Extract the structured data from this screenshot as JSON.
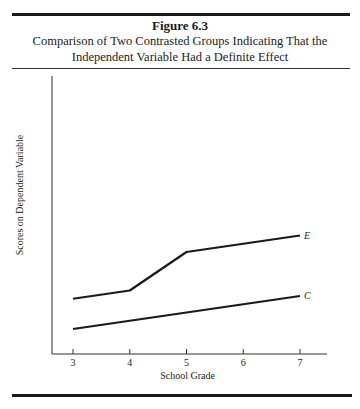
{
  "figure": {
    "number": "Figure 6.3",
    "caption_line1": "Comparison of Two Contrasted Groups Indicating That the",
    "caption_line2": "Independent Variable Had a Definite Effect"
  },
  "chart_data": {
    "type": "line",
    "title": "Comparison of Two Contrasted Groups Indicating That the Independent Variable Had a Definite Effect",
    "xlabel": "School Grade",
    "ylabel": "Scores on Dependent Variable",
    "x": [
      3,
      4,
      5,
      6,
      7
    ],
    "x_ticks": [
      "3",
      "4",
      "5",
      "6",
      "7"
    ],
    "y_ticks": [],
    "grid": false,
    "legend": "inline labels at line ends",
    "series": [
      {
        "name": "E",
        "label": "E",
        "x": [
          3,
          4,
          5,
          7
        ],
        "values": [
          1.9,
          2.2,
          3.6,
          4.2
        ]
      },
      {
        "name": "C",
        "label": "C",
        "x": [
          3,
          5,
          7
        ],
        "values": [
          0.8,
          1.4,
          2.0
        ]
      }
    ]
  }
}
